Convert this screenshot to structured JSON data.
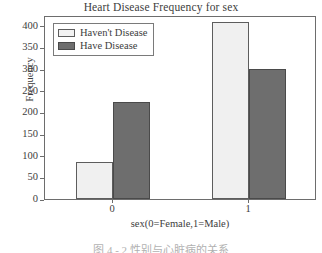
{
  "chart_data": {
    "type": "bar",
    "title": "Heart Disease Frequency for sex",
    "xlabel": "sex(0=Female,1=Male)",
    "ylabel": "Frequency",
    "categories": [
      "0",
      "1"
    ],
    "series": [
      {
        "name": "Haven't Disease",
        "values": [
          85,
          410
        ],
        "color": "#f0f0f0"
      },
      {
        "name": "Have Disease",
        "values": [
          225,
          300
        ],
        "color": "#6e6e6e"
      }
    ],
    "ylim": [
      0,
      425
    ],
    "yticks": [
      0,
      50,
      100,
      150,
      200,
      250,
      300,
      350,
      400
    ],
    "xticks": [
      "0",
      "1"
    ],
    "grid": false,
    "legend_position": "upper left"
  },
  "legend": {
    "items": [
      {
        "label": "Haven't Disease"
      },
      {
        "label": "Have Disease"
      }
    ]
  },
  "caption": {
    "text": "图 4 - 2  性别与心脏病的关系"
  }
}
